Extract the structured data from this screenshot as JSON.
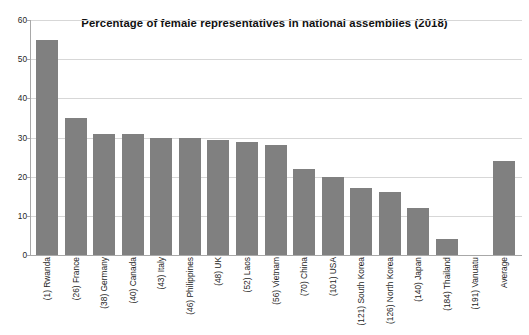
{
  "chart_data": {
    "type": "bar",
    "title": "Percentage of female representatives in national assemblies (2018)",
    "xlabel": "",
    "ylabel": "",
    "ylim": [
      0,
      60
    ],
    "yticks": [
      0,
      10,
      20,
      30,
      40,
      50,
      60
    ],
    "grid": true,
    "legend": false,
    "bar_color": "#808080",
    "categories": [
      "(1) Rwanda",
      "(26) France",
      "(38) Germany",
      "(40) Canada",
      "(43) Italy",
      "(46) Philippines",
      "(48) UK",
      "(52) Laos",
      "(56) Vietnam",
      "(70) China",
      "(101) USA",
      "(121) South Korea",
      "(126) North Korea",
      "(140) Japan",
      "(184) Thailand",
      "(191) Vanuatu",
      "Average"
    ],
    "values": [
      55,
      35,
      31,
      31,
      30,
      29.8,
      29.4,
      28.8,
      28,
      22,
      20,
      17,
      16,
      12,
      4,
      0,
      24
    ]
  },
  "axis": {
    "y_tick_labels": [
      "60",
      "50",
      "40",
      "30",
      "20",
      "10",
      "0"
    ]
  }
}
